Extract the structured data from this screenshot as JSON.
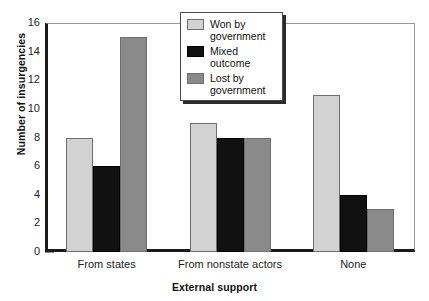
{
  "chart_data": {
    "type": "bar",
    "title": "",
    "xlabel": "External support",
    "ylabel": "Number of insurgencies",
    "categories": [
      "From states",
      "From nonstate actors",
      "None"
    ],
    "series": [
      {
        "name": "Won by government",
        "color": "#d2d2d2",
        "values": [
          8,
          9,
          11
        ]
      },
      {
        "name": "Mixed outcome",
        "color": "#111111",
        "values": [
          6,
          8,
          4
        ]
      },
      {
        "name": "Lost by government",
        "color": "#8a8a8a",
        "values": [
          15,
          8,
          3
        ]
      }
    ],
    "ylim": [
      0,
      16
    ],
    "ytick_step": 2,
    "yticks": [
      0,
      2,
      4,
      6,
      8,
      10,
      12,
      14,
      16
    ],
    "ytick_labels": [
      "0",
      "2",
      "4",
      "6",
      "8",
      "10",
      "12",
      "14",
      "16"
    ],
    "grid": false,
    "legend_position": "top-center",
    "legend_entries": [
      {
        "label_line1": "Won by",
        "label_line2": "government"
      },
      {
        "label_line1": "Mixed",
        "label_line2": "outcome"
      },
      {
        "label_line1": "Lost by",
        "label_line2": "government"
      }
    ]
  }
}
